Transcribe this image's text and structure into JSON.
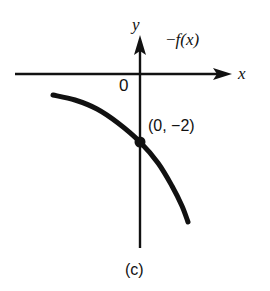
{
  "figure": {
    "caption": "(c)",
    "background_color": "#ffffff",
    "stroke_color": "#111111"
  },
  "axes": {
    "y_axis_label": "y",
    "x_axis_label": "x",
    "origin_label": "0",
    "x_axis": {
      "x_start": 15,
      "x_end": 228,
      "y": 74
    },
    "y_axis": {
      "x": 140,
      "y_start": 36,
      "y_end": 248
    }
  },
  "annotations": {
    "function_label_minus": "−",
    "function_label_f": "f",
    "function_label_arg": "(x)",
    "function_label_full": "−f(x)",
    "point_label": "(0, −2)"
  },
  "chart_data": {
    "type": "line",
    "title": "",
    "subtitle": "",
    "xlabel": "x",
    "ylabel": "y",
    "caption": "(c)",
    "grid": false,
    "legend": "none",
    "annotations": [
      {
        "text": "−f(x)",
        "x_px": 166,
        "y_px": 31
      },
      {
        "text": "(0, −2)",
        "x_px": 148,
        "y_px": 118
      },
      {
        "text": "0",
        "x_px": 119,
        "y_px": 77
      }
    ],
    "marked_points": [
      {
        "label": "(0, −2)",
        "x": 0,
        "y": -2,
        "x_px": 140,
        "y_px": 142,
        "style": "filled-dot"
      }
    ],
    "series": [
      {
        "name": "−f(x)",
        "kind": "curve",
        "stroke": "#111111",
        "stroke_width_px": 5,
        "points_px": [
          [
            53,
            95
          ],
          [
            75,
            100
          ],
          [
            97,
            109
          ],
          [
            118,
            123
          ],
          [
            140,
            142
          ],
          [
            158,
            163
          ],
          [
            172,
            186
          ],
          [
            182,
            206
          ],
          [
            188,
            222
          ]
        ]
      }
    ],
    "axis_ranges": {
      "x_px": [
        15,
        228
      ],
      "y_px": [
        36,
        248
      ]
    }
  }
}
